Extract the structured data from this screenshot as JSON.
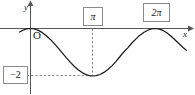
{
  "figure": {
    "title": "",
    "background_color": "#ffffff",
    "curve_color": "#1a1a1a",
    "axis_color": "#555555",
    "dashed_color": "#777777",
    "box_border_color": "#8a8a8a"
  },
  "axes": {
    "y_label": "y",
    "x_label": "x",
    "origin_label": "O"
  },
  "labels": {
    "pi": "π",
    "two_pi": "2π",
    "minus_two": "−2"
  },
  "chart_data": {
    "type": "line",
    "title": "",
    "xlabel": "x",
    "ylabel": "y",
    "xlim": [
      -0.55,
      7.85
    ],
    "ylim": [
      -2.6,
      0.6
    ],
    "grid": false,
    "legend": null,
    "function": "y = cos(x) - 1",
    "amplitude": 1,
    "vertical_shift": -1,
    "period": 6.2832,
    "minimum": {
      "x": 3.1416,
      "y": -2,
      "x_label": "π",
      "y_label": "−2"
    },
    "maxima": [
      {
        "x": 0,
        "y": 0
      },
      {
        "x": 6.2832,
        "y": 0,
        "x_label": "2π"
      }
    ],
    "tick_labels": {
      "x": [
        "π",
        "2π"
      ],
      "y": [
        "−2"
      ]
    },
    "annotations": [
      {
        "text": "π",
        "type": "boxed-x-tick",
        "x": 3.1416
      },
      {
        "text": "2π",
        "type": "boxed-x-tick",
        "x": 6.2832
      },
      {
        "text": "−2",
        "type": "boxed-y-tick",
        "y": -2
      }
    ],
    "guide_lines": [
      {
        "orientation": "vertical",
        "at": 3.1416,
        "style": "dashed",
        "from": 0,
        "to": -2
      },
      {
        "orientation": "horizontal",
        "at": -2,
        "style": "dashed",
        "from": 0,
        "to": 3.1416
      }
    ],
    "x": [
      -0.55,
      -0.4,
      -0.2,
      0,
      0.2,
      0.4,
      0.6,
      0.8,
      1.0,
      1.2,
      1.4,
      1.6,
      1.8,
      2.0,
      2.2,
      2.4,
      2.6,
      2.8,
      3.0,
      3.1416,
      3.3,
      3.5,
      3.7,
      3.9,
      4.1,
      4.3,
      4.5,
      4.7,
      4.9,
      5.1,
      5.3,
      5.5,
      5.7,
      5.9,
      6.1,
      6.2832,
      6.5,
      6.7,
      6.9,
      7.1,
      7.3,
      7.5,
      7.7,
      7.85
    ],
    "y": [
      -0.147,
      -0.079,
      -0.02,
      0,
      -0.02,
      -0.079,
      -0.175,
      -0.303,
      -0.46,
      -0.638,
      -0.83,
      -1.029,
      -1.227,
      -1.416,
      -1.589,
      -1.737,
      -1.857,
      -1.942,
      -1.99,
      -2.0,
      -1.987,
      -1.936,
      -1.849,
      -1.726,
      -1.573,
      -1.393,
      -1.19,
      -0.988,
      -0.814,
      -0.622,
      -0.446,
      -0.291,
      -0.166,
      -0.073,
      -0.017,
      0,
      -0.024,
      -0.092,
      -0.199,
      -0.337,
      -0.497,
      -0.654,
      -0.81,
      -0.915
    ]
  }
}
